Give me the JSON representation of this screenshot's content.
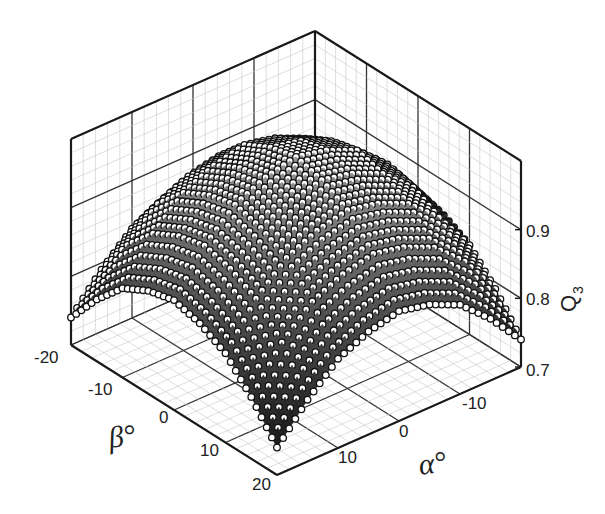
{
  "chart_data": {
    "type": "scatter3d-surface",
    "title": "",
    "xlabel": "α°",
    "ylabel": "β°",
    "zlabel": "Q3",
    "zlabel_main": "Q",
    "zlabel_sub": "3",
    "alpha_ticks": [
      "-10",
      "0",
      "10"
    ],
    "alpha_tick_values": [
      -10,
      0,
      10
    ],
    "beta_ticks": [
      "-20",
      "-10",
      "0",
      "10",
      "20"
    ],
    "beta_tick_values": [
      -20,
      -10,
      0,
      10,
      20
    ],
    "z_ticks": [
      "0.7",
      "0.8",
      "0.9"
    ],
    "z_tick_values": [
      0.7,
      0.8,
      0.9
    ],
    "alpha_range": [
      -20,
      20
    ],
    "beta_range": [
      -20,
      20
    ],
    "zlim": [
      0.7,
      1.0
    ],
    "grid": true,
    "grid_axes": [
      -20,
      -15,
      -10,
      -5,
      0,
      5,
      10,
      15,
      20
    ],
    "q3_grid_alpha_beta": [
      [
        0.74,
        0.79,
        0.83,
        0.85,
        0.86,
        0.85,
        0.83,
        0.79,
        0.74
      ],
      [
        0.79,
        0.85,
        0.89,
        0.91,
        0.92,
        0.91,
        0.89,
        0.85,
        0.79
      ],
      [
        0.83,
        0.89,
        0.93,
        0.95,
        0.96,
        0.95,
        0.93,
        0.89,
        0.83
      ],
      [
        0.85,
        0.91,
        0.95,
        0.97,
        0.98,
        0.97,
        0.95,
        0.91,
        0.85
      ],
      [
        0.86,
        0.92,
        0.96,
        0.98,
        0.99,
        0.98,
        0.96,
        0.92,
        0.86
      ],
      [
        0.85,
        0.91,
        0.95,
        0.97,
        0.98,
        0.97,
        0.95,
        0.91,
        0.85
      ],
      [
        0.83,
        0.89,
        0.93,
        0.95,
        0.96,
        0.95,
        0.93,
        0.89,
        0.83
      ],
      [
        0.79,
        0.85,
        0.89,
        0.91,
        0.92,
        0.91,
        0.89,
        0.85,
        0.79
      ],
      [
        0.74,
        0.79,
        0.83,
        0.85,
        0.86,
        0.85,
        0.83,
        0.79,
        0.74
      ]
    ],
    "sample_step_deg": 1
  },
  "colors": {
    "axis": "#1a1a1a",
    "major_grid": "#333333",
    "minor_grid": "#c8c8c8",
    "marker_fill": "#ffffff",
    "marker_edge": "#111111",
    "surface_light": "#b0b0b0",
    "surface_dark": "#101010"
  }
}
